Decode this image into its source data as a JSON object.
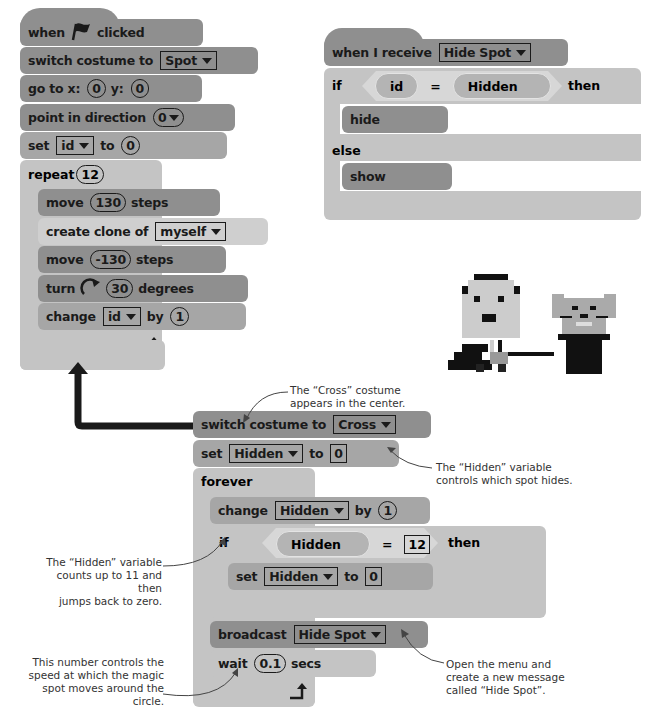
{
  "colors": {
    "dark_block": "#8f8f8f",
    "mid_block": "#a6a6a6",
    "light_block": "#c4c4c4",
    "connector": "#1a1a1a",
    "note_text": "#333333"
  },
  "flag_script": {
    "hat": {
      "when": "when",
      "flag_icon": "green-flag",
      "clicked": "clicked"
    },
    "switch_costume": {
      "label": "switch costume to",
      "value": "Spot"
    },
    "goto": {
      "label": "go to x:",
      "x": "0",
      "y_label": "y:",
      "y": "0"
    },
    "point": {
      "label": "point in direction",
      "value": "0"
    },
    "set_id": {
      "label": "set",
      "var": "id",
      "to": "to",
      "value": "0"
    },
    "repeat": {
      "label": "repeat",
      "count": "12"
    },
    "move1": {
      "label": "move",
      "value": "130",
      "suffix": "steps"
    },
    "clone": {
      "label": "create clone of",
      "value": "myself"
    },
    "move2": {
      "label": "move",
      "value": "-130",
      "suffix": "steps"
    },
    "turn": {
      "label": "turn",
      "value": "30",
      "suffix": "degrees"
    },
    "change_id": {
      "label": "change",
      "var": "id",
      "by": "by",
      "value": "1"
    },
    "loop_arrow": "loop-arrow"
  },
  "receive_script": {
    "hat": {
      "label": "when I receive",
      "value": "Hide Spot"
    },
    "if": {
      "label": "if",
      "left": "id",
      "op": "=",
      "right": "Hidden",
      "then": "then"
    },
    "hide": "hide",
    "else": "else",
    "show": "show"
  },
  "cross_script": {
    "switch_costume": {
      "label": "switch costume to",
      "value": "Cross"
    },
    "set_hidden": {
      "label": "set",
      "var": "Hidden",
      "to": "to",
      "value": "0"
    },
    "forever": "forever",
    "change_hidden": {
      "label": "change",
      "var": "Hidden",
      "by": "by",
      "value": "1"
    },
    "if": {
      "label": "if",
      "left": "Hidden",
      "op": "=",
      "right": "12",
      "then": "then"
    },
    "inner_set": {
      "label": "set",
      "var": "Hidden",
      "to": "to",
      "value": "0"
    },
    "broadcast": {
      "label": "broadcast",
      "value": "Hide Spot"
    },
    "wait": {
      "label": "wait",
      "value": "0.1",
      "suffix": "secs"
    }
  },
  "notes": {
    "cross": [
      "The “Cross” costume",
      "appears in the center."
    ],
    "hidden_var": [
      "The “Hidden” variable",
      "controls which spot hides."
    ],
    "counts": [
      "The “Hidden” variable",
      "counts up to 11 and then",
      "jumps back to zero."
    ],
    "speed": [
      "This number controls the",
      "speed at which the magic",
      "spot moves around the circle."
    ],
    "menu": [
      "Open the menu and",
      "create a new message",
      "called “Hide Spot”."
    ]
  }
}
